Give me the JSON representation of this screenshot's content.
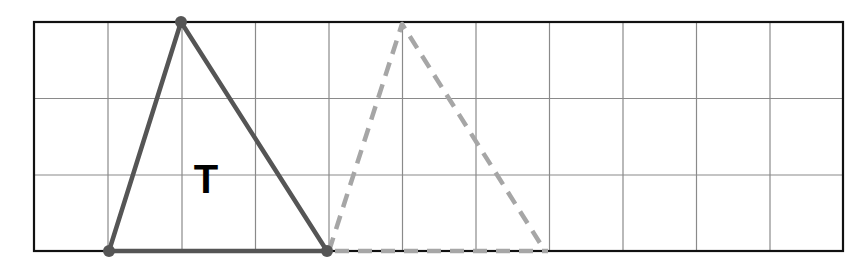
{
  "diagram": {
    "grid": {
      "columns": 11,
      "rows": 3,
      "left": 34,
      "top": 22,
      "cell_width": 73.5,
      "cell_height": 76.3,
      "line_color": "#888888",
      "border_color": "#111111"
    },
    "shapes": [
      {
        "name": "triangle-T",
        "label": "T",
        "style": "solid",
        "color": "#555555",
        "vertices": [
          [
            1,
            3
          ],
          [
            2,
            0
          ],
          [
            4,
            3
          ]
        ]
      },
      {
        "name": "triangle-image",
        "label": "",
        "style": "dashed",
        "color": "#a6a6a6",
        "vertices": [
          [
            4,
            3
          ],
          [
            5,
            0
          ],
          [
            7,
            3
          ]
        ]
      }
    ],
    "label_T": "T"
  }
}
